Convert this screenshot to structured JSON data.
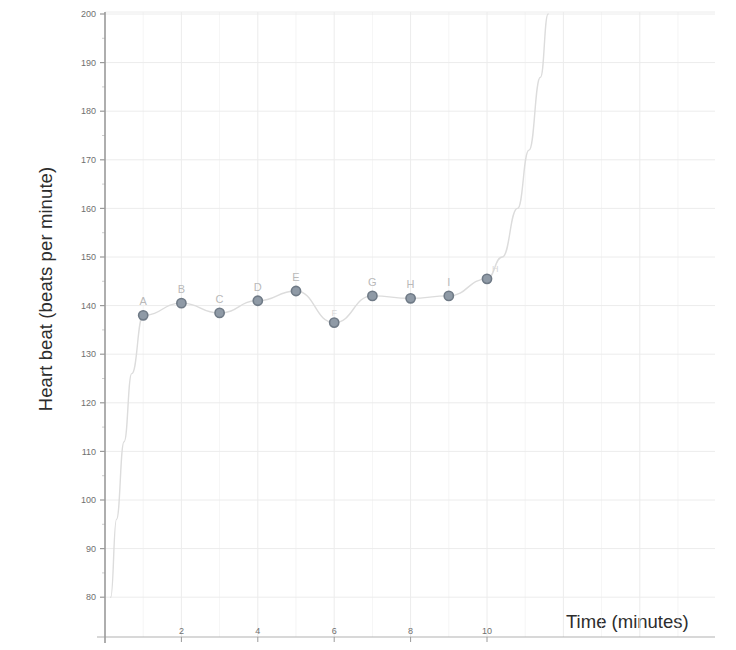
{
  "chart_data": {
    "type": "line",
    "title": "",
    "xlabel": "Time (minutes)",
    "ylabel": "Heart beat (beats per minute)",
    "xlim": [
      0,
      12
    ],
    "ylim": [
      75,
      200
    ],
    "xticks": [
      2,
      4,
      6,
      8,
      10
    ],
    "yticks": [
      80,
      90,
      100,
      110,
      120,
      130,
      140,
      150,
      160,
      170,
      180,
      190,
      200
    ],
    "grid": true,
    "legend": null,
    "series": [
      {
        "name": "Heart beat",
        "x": [
          0.15,
          0.3,
          0.5,
          0.7,
          1,
          2,
          3,
          4,
          5,
          6,
          7,
          8,
          9,
          10,
          10.4,
          10.8,
          11.1,
          11.4,
          11.6
        ],
        "values": [
          80,
          96,
          112,
          126,
          138,
          140.5,
          138.5,
          141,
          143,
          136.5,
          142,
          141.5,
          142,
          145.5,
          150,
          160,
          172,
          187,
          200
        ]
      }
    ],
    "markers": [
      {
        "label": "A",
        "x": 1,
        "y": 138.0
      },
      {
        "label": "B",
        "x": 2,
        "y": 140.5
      },
      {
        "label": "C",
        "x": 3,
        "y": 138.5
      },
      {
        "label": "D",
        "x": 4,
        "y": 141.0
      },
      {
        "label": "E",
        "x": 5,
        "y": 143.0
      },
      {
        "label": "F",
        "x": 6,
        "y": 136.5
      },
      {
        "label": "G",
        "x": 7,
        "y": 142.0
      },
      {
        "label": "H",
        "x": 8,
        "y": 141.5
      },
      {
        "label": "I",
        "x": 9,
        "y": 142.0
      },
      {
        "label": "H",
        "x": 10,
        "y": 145.5
      }
    ],
    "colors": {
      "marker": "#8f9aa6",
      "marker_edge": "#6f7a86",
      "line": "#dcdcdc",
      "grid": "#ececec",
      "axis": "#9a9a9a",
      "tick_text": "#6f6f6f",
      "label_text": "#2d2d2d",
      "point_label": "#bcbcbc",
      "background": "#ffffff"
    }
  }
}
